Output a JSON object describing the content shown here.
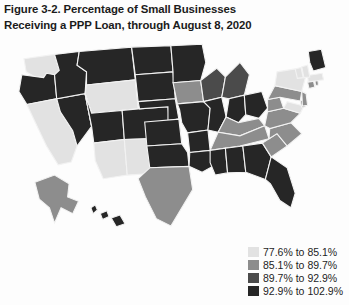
{
  "figure": {
    "title_line1": "Figure 3-2. Percentage of Small Businesses",
    "title_line2": "Receiving a PPP Loan, through August 8, 2020"
  },
  "legend": {
    "items": [
      {
        "label": "77.6% to 85.1%",
        "color": "#e2e2e2"
      },
      {
        "label": "85.1% to 89.7%",
        "color": "#8d8d8d"
      },
      {
        "label": "89.7% to 92.9%",
        "color": "#4b4b4b"
      },
      {
        "label": "92.9% to 102.9%",
        "color": "#262626"
      }
    ]
  },
  "chart_data": {
    "type": "map",
    "title": "Figure 3-2. Percentage of Small Businesses Receiving a PPP Loan, through August 8, 2020",
    "measure": "Percentage of small businesses receiving a PPP loan",
    "as_of_date": "August 8, 2020",
    "geography": "United States — states",
    "classification": "quartile choropleth, 4 classes, grayscale ramp light-to-dark",
    "bins": [
      {
        "bin": 1,
        "range": "77.6% to 85.1%",
        "min": 77.6,
        "max": 85.1,
        "color": "#e2e2e2"
      },
      {
        "bin": 2,
        "range": "85.1% to 89.7%",
        "min": 85.1,
        "max": 89.7,
        "color": "#8d8d8d"
      },
      {
        "bin": 3,
        "range": "89.7% to 92.9%",
        "min": 89.7,
        "max": 92.9,
        "color": "#4b4b4b"
      },
      {
        "bin": 4,
        "range": "92.9% to 102.9%",
        "min": 92.9,
        "max": 102.9,
        "color": "#262626"
      }
    ],
    "legend_position": "bottom-right",
    "grid": false,
    "states": [
      {
        "id": "WA",
        "name": "Washington",
        "bin": 1,
        "color": "#e2e2e2"
      },
      {
        "id": "OR",
        "name": "Oregon",
        "bin": 4,
        "color": "#262626"
      },
      {
        "id": "CA",
        "name": "California",
        "bin": 1,
        "color": "#e2e2e2"
      },
      {
        "id": "NV",
        "name": "Nevada",
        "bin": 4,
        "color": "#262626"
      },
      {
        "id": "ID",
        "name": "Idaho",
        "bin": 4,
        "color": "#262626"
      },
      {
        "id": "MT",
        "name": "Montana",
        "bin": 4,
        "color": "#262626"
      },
      {
        "id": "WY",
        "name": "Wyoming",
        "bin": 1,
        "color": "#e2e2e2"
      },
      {
        "id": "UT",
        "name": "Utah",
        "bin": 4,
        "color": "#262626"
      },
      {
        "id": "CO",
        "name": "Colorado",
        "bin": 4,
        "color": "#262626"
      },
      {
        "id": "AZ",
        "name": "Arizona",
        "bin": 1,
        "color": "#e2e2e2"
      },
      {
        "id": "NM",
        "name": "New Mexico",
        "bin": 1,
        "color": "#e2e2e2"
      },
      {
        "id": "ND",
        "name": "North Dakota",
        "bin": 4,
        "color": "#262626"
      },
      {
        "id": "SD",
        "name": "South Dakota",
        "bin": 4,
        "color": "#262626"
      },
      {
        "id": "NE",
        "name": "Nebraska",
        "bin": 4,
        "color": "#262626"
      },
      {
        "id": "KS",
        "name": "Kansas",
        "bin": 4,
        "color": "#262626"
      },
      {
        "id": "OK",
        "name": "Oklahoma",
        "bin": 4,
        "color": "#262626"
      },
      {
        "id": "TX",
        "name": "Texas",
        "bin": 2,
        "color": "#8d8d8d"
      },
      {
        "id": "MN",
        "name": "Minnesota",
        "bin": 4,
        "color": "#262626"
      },
      {
        "id": "IA",
        "name": "Iowa",
        "bin": 2,
        "color": "#8d8d8d"
      },
      {
        "id": "MO",
        "name": "Missouri",
        "bin": 4,
        "color": "#262626"
      },
      {
        "id": "AR",
        "name": "Arkansas",
        "bin": 4,
        "color": "#262626"
      },
      {
        "id": "LA",
        "name": "Louisiana",
        "bin": 4,
        "color": "#262626"
      },
      {
        "id": "WI",
        "name": "Wisconsin",
        "bin": 3,
        "color": "#4b4b4b"
      },
      {
        "id": "IL",
        "name": "Illinois",
        "bin": 4,
        "color": "#262626"
      },
      {
        "id": "MI",
        "name": "Michigan",
        "bin": 3,
        "color": "#4b4b4b"
      },
      {
        "id": "IN",
        "name": "Indiana",
        "bin": 4,
        "color": "#262626"
      },
      {
        "id": "OH",
        "name": "Ohio",
        "bin": 4,
        "color": "#262626"
      },
      {
        "id": "KY",
        "name": "Kentucky",
        "bin": 2,
        "color": "#8d8d8d"
      },
      {
        "id": "TN",
        "name": "Tennessee",
        "bin": 2,
        "color": "#8d8d8d"
      },
      {
        "id": "MS",
        "name": "Mississippi",
        "bin": 4,
        "color": "#262626"
      },
      {
        "id": "AL",
        "name": "Alabama",
        "bin": 4,
        "color": "#262626"
      },
      {
        "id": "GA",
        "name": "Georgia",
        "bin": 4,
        "color": "#262626"
      },
      {
        "id": "FL",
        "name": "Florida",
        "bin": 4,
        "color": "#262626"
      },
      {
        "id": "SC",
        "name": "South Carolina",
        "bin": 2,
        "color": "#8d8d8d"
      },
      {
        "id": "NC",
        "name": "North Carolina",
        "bin": 2,
        "color": "#8d8d8d"
      },
      {
        "id": "VA",
        "name": "Virginia",
        "bin": 2,
        "color": "#8d8d8d"
      },
      {
        "id": "WV",
        "name": "West Virginia",
        "bin": 2,
        "color": "#8d8d8d"
      },
      {
        "id": "MD",
        "name": "Maryland",
        "bin": 1,
        "color": "#e2e2e2"
      },
      {
        "id": "DE",
        "name": "Delaware",
        "bin": 2,
        "color": "#8d8d8d"
      },
      {
        "id": "PA",
        "name": "Pennsylvania",
        "bin": 2,
        "color": "#8d8d8d"
      },
      {
        "id": "NJ",
        "name": "New Jersey",
        "bin": 2,
        "color": "#8d8d8d"
      },
      {
        "id": "NY",
        "name": "New York",
        "bin": 1,
        "color": "#e2e2e2"
      },
      {
        "id": "CT",
        "name": "Connecticut",
        "bin": 2,
        "color": "#8d8d8d"
      },
      {
        "id": "RI",
        "name": "Rhode Island",
        "bin": 2,
        "color": "#8d8d8d"
      },
      {
        "id": "MA",
        "name": "Massachusetts",
        "bin": 1,
        "color": "#e2e2e2"
      },
      {
        "id": "VT",
        "name": "Vermont",
        "bin": 1,
        "color": "#e2e2e2"
      },
      {
        "id": "NH",
        "name": "New Hampshire",
        "bin": 1,
        "color": "#e2e2e2"
      },
      {
        "id": "ME",
        "name": "Maine",
        "bin": 4,
        "color": "#262626"
      },
      {
        "id": "AK",
        "name": "Alaska",
        "bin": 2,
        "color": "#8d8d8d"
      },
      {
        "id": "HI",
        "name": "Hawaii",
        "bin": 4,
        "color": "#262626"
      }
    ]
  }
}
